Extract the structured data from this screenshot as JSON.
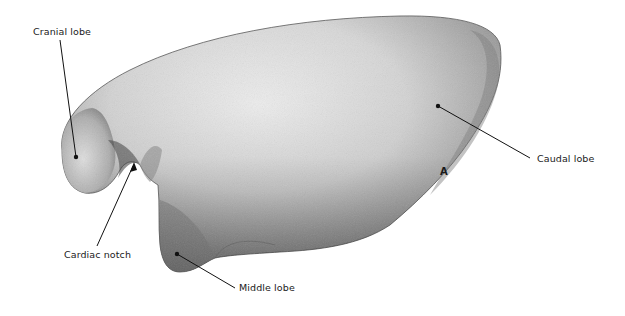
{
  "figure": {
    "panel_letter": "A"
  },
  "labels": {
    "cranial_lobe": "Cranial lobe",
    "cardiac_notch": "Cardiac notch",
    "middle_lobe": "Middle lobe",
    "caudal_lobe": "Caudal lobe"
  }
}
